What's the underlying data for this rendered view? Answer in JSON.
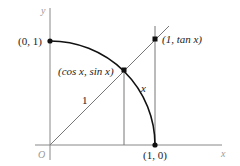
{
  "diagram": {
    "type": "unit-circle-trig",
    "axes": {
      "x_label": "x",
      "y_label": "y",
      "origin_label": "O"
    },
    "points": {
      "top": "(0, 1)",
      "right": "(1, 0)",
      "on_circle": "(cos x, sin x)",
      "tangent": "(1, tan x)"
    },
    "segment_labels": {
      "radius": "1",
      "arc": "x"
    },
    "colors": {
      "axis": "#888888",
      "curve": "#111111",
      "line": "#777777",
      "text": "#222222"
    }
  }
}
